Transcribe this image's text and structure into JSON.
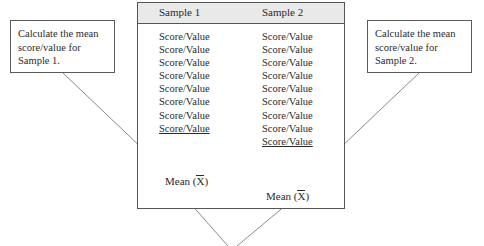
{
  "diagram": {
    "notes": {
      "left": {
        "line1": "Calculate the mean",
        "line2": "score/value for",
        "line3": "Sample 1."
      },
      "right": {
        "line1": "Calculate the mean",
        "line2": "score/value for",
        "line3": "Sample 2."
      }
    },
    "table": {
      "headers": [
        "Sample 1",
        "Sample 2"
      ],
      "columns": [
        {
          "header": "Sample 1",
          "cells": [
            "Score/Value",
            "Score/Value",
            "Score/Value",
            "Score/Value",
            "Score/Value",
            "Score/Value",
            "Score/Value",
            "Score/Value"
          ],
          "underlined_index": 7,
          "mean_label": "Mean (",
          "mean_symbol": "X",
          "mean_close": ")"
        },
        {
          "header": "Sample 2",
          "cells": [
            "Score/Value",
            "Score/Value",
            "Score/Value",
            "Score/Value",
            "Score/Value",
            "Score/Value",
            "Score/Value",
            "Score/Value",
            "Score/Value"
          ],
          "underlined_index": 8,
          "mean_label": "Mean (",
          "mean_symbol": "X",
          "mean_close": ")"
        }
      ]
    },
    "colors": {
      "header_band": "#e9e9e9",
      "border": "#555555",
      "text": "#2b2b2b",
      "connector": "#8a8a8a"
    }
  }
}
